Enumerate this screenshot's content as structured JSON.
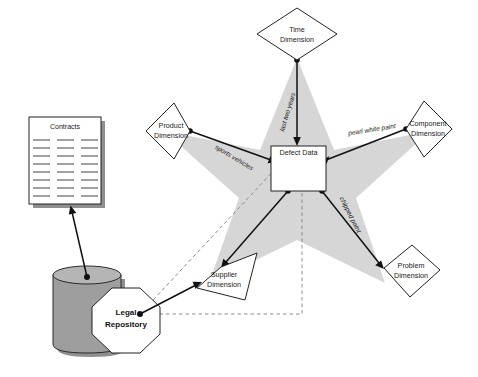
{
  "diagram": {
    "type": "star-schema",
    "colors": {
      "star_fill": "#d6d6d6",
      "node_fill": "#ffffff",
      "node_stroke": "#232323",
      "solid_edge": "#111111",
      "dashed_edge": "#8c8c8c",
      "cylinder_fill": "#9e9e9e",
      "shadow": "#8f8f8f"
    },
    "fact_table": {
      "label": "Defect Data",
      "shape": "rectangle"
    },
    "dimensions": [
      {
        "id": "time",
        "label_line1": "Time",
        "label_line2": "Dimension",
        "shape": "diamond",
        "position": "top"
      },
      {
        "id": "product",
        "label_line1": "Product",
        "label_line2": "Dimension",
        "shape": "diamond",
        "position": "left"
      },
      {
        "id": "component",
        "label_line1": "Component",
        "label_line2": "Dimension",
        "shape": "diamond",
        "position": "right"
      },
      {
        "id": "supplier",
        "label_line1": "Supplier",
        "label_line2": "Dimension",
        "shape": "diamond",
        "position": "bottom-left"
      },
      {
        "id": "problem",
        "label_line1": "Problem",
        "label_line2": "Dimension",
        "shape": "diamond",
        "position": "bottom-right"
      }
    ],
    "edge_labels": [
      {
        "id": "time-edge",
        "text": "last two years"
      },
      {
        "id": "product-edge",
        "text": "sports vehicles"
      },
      {
        "id": "component-edge",
        "text": "pearl white paint"
      },
      {
        "id": "problem-edge",
        "text": "chipped paint"
      }
    ],
    "source_nodes": {
      "contracts": {
        "label": "Contracts",
        "shape": "document"
      },
      "database": {
        "label": "",
        "shape": "cylinder"
      },
      "repository": {
        "label_line1": "Legal",
        "label_line2": "Repository",
        "shape": "octagon"
      }
    }
  }
}
